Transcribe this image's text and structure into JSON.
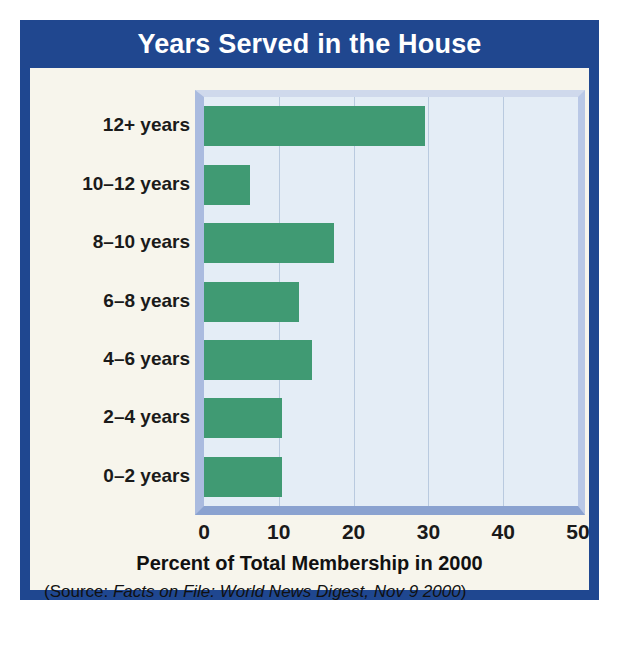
{
  "figure": {
    "title": "Years Served in the House",
    "axis_label": "Percent of Total Membership in 2000",
    "source_prefix": "(Source: ",
    "source_italic": "Facts on File: World News Digest, Nov 9 2000",
    "source_suffix": ")"
  },
  "colors": {
    "title_bar": "#20478f",
    "frame_border": "#1f4790",
    "card_background": "#f7f5ec",
    "plot_background": "#e4edf6",
    "bar": "#409a73",
    "gridline": "#b9cadf",
    "text": "#1a1a1a"
  },
  "chart_data": {
    "type": "bar",
    "orientation": "horizontal",
    "title": "Years Served in the House",
    "xlabel": "Percent of Total Membership in 2000",
    "ylabel": "",
    "xlim": [
      0,
      50
    ],
    "xticks": [
      0,
      10,
      20,
      30,
      40,
      50
    ],
    "xtick_labels": [
      "0",
      "10",
      "20",
      "30",
      "40",
      "50"
    ],
    "grid": true,
    "grid_axis": "x",
    "legend": false,
    "categories": [
      "12+ years",
      "10–12 years",
      "8–10 years",
      "6–8 years",
      "4–6 years",
      "2–4 years",
      "0–2 years"
    ],
    "values": [
      29.5,
      6.1,
      17.4,
      12.7,
      14.4,
      10.4,
      10.4
    ],
    "series": [
      {
        "name": "Percent of Total Membership in 2000",
        "color": "#409a73",
        "values": [
          29.5,
          6.1,
          17.4,
          12.7,
          14.4,
          10.4,
          10.4
        ]
      }
    ],
    "source": "(Source: Facts on File: World News Digest, Nov 9 2000)"
  }
}
